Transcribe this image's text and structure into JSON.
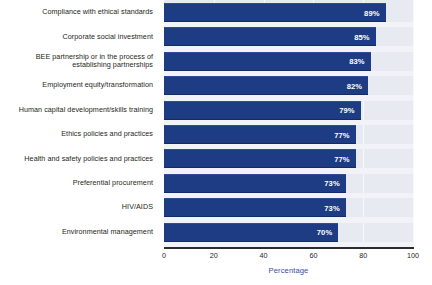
{
  "chart_data": {
    "type": "bar",
    "orientation": "horizontal",
    "title": "",
    "xlabel": "Percentage",
    "ylabel": "",
    "xlim": [
      0,
      100
    ],
    "xticks": [
      0,
      20,
      40,
      60,
      80,
      100
    ],
    "grid": true,
    "legend": null,
    "categories": [
      "Compliance with ethical standards",
      "Corporate social investment",
      "BEE partnership or in the process of\nestablishing partnerships",
      "Employment equity/transformation",
      "Human capital development/skills training",
      "Ethics policies and practices",
      "Health and safety policies and practices",
      "Preferential procurement",
      "HIV/AIDS",
      "Environmental management"
    ],
    "values": [
      89,
      85,
      83,
      82,
      79,
      77,
      77,
      73,
      73,
      70
    ],
    "value_labels": [
      "89%",
      "85%",
      "83%",
      "82%",
      "79%",
      "77%",
      "77%",
      "73%",
      "73%",
      "70%"
    ]
  },
  "colors": {
    "bar": "#1d3c84",
    "plot_background": "#e8eaf2",
    "gridline": "#f7f8fb",
    "axis_line": "#2b2b2b",
    "label_text": "#231f20",
    "axis_title_text": "#3b4aa0",
    "value_text": "#ffffff"
  }
}
